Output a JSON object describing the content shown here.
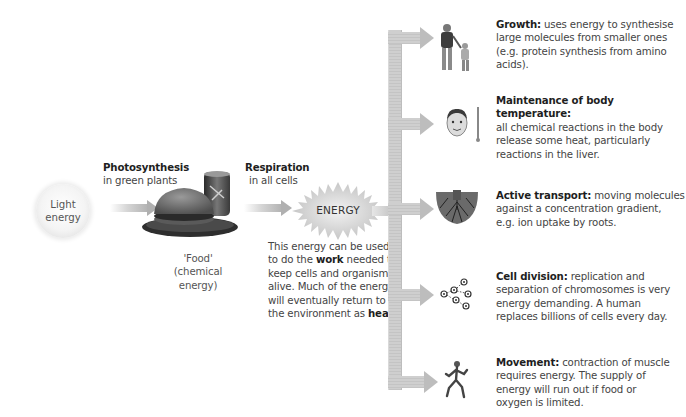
{
  "source": {
    "label_line1": "Light",
    "label_line2": "energy"
  },
  "photosynthesis": {
    "title": "Photosynthesis",
    "subtitle": "in green plants"
  },
  "food": {
    "line1": "'Food'",
    "line2": "(chemical",
    "line3": "energy)",
    "icon": "food-burger-can-illustration"
  },
  "respiration": {
    "title": "Respiration",
    "subtitle": "in all cells"
  },
  "energy": {
    "label": "ENERGY",
    "icon": "starburst"
  },
  "energy_note": {
    "line1": "This energy can be used",
    "line2_pre": "to do the ",
    "line2_bold": "work",
    "line2_post": " needed to",
    "line3": "keep cells and organisms",
    "line4": "alive. Much of the energy",
    "line5": "will eventually return to",
    "line6_pre": "the environment as ",
    "line6_bold": "heat."
  },
  "uses": [
    {
      "title": "Growth:",
      "lines": [
        " uses energy to synthesise",
        "large molecules from smaller ones",
        "(e.g. protein synthesis from amino",
        "acids)."
      ],
      "icon": "adult-and-child-icon"
    },
    {
      "title": "Maintenance of body temperature:",
      "lines": [
        "",
        "all chemical reactions in the body",
        "release some heat, particularly",
        "reactions in the liver."
      ],
      "icon": "face-thermometer-icon"
    },
    {
      "title": "Active transport:",
      "lines": [
        " moving molecules",
        "against a concentration gradient,",
        "e.g. ion uptake by roots."
      ],
      "icon": "roots-icon"
    },
    {
      "title": "Cell division:",
      "lines": [
        " replication and",
        "separation of chromosomes is very",
        "energy demanding. A human",
        "replaces billions of cells every day."
      ],
      "icon": "dividing-cells-icon"
    },
    {
      "title": "Movement:",
      "lines": [
        " contraction of muscle",
        "requires energy. The supply of",
        "energy will run out if food or",
        "oxygen is limited."
      ],
      "icon": "running-man-icon"
    }
  ],
  "colors": {
    "arrow": "#b8b8b8",
    "text": "#444444",
    "bold_text": "#1e1e1e",
    "background": "#ffffff"
  }
}
